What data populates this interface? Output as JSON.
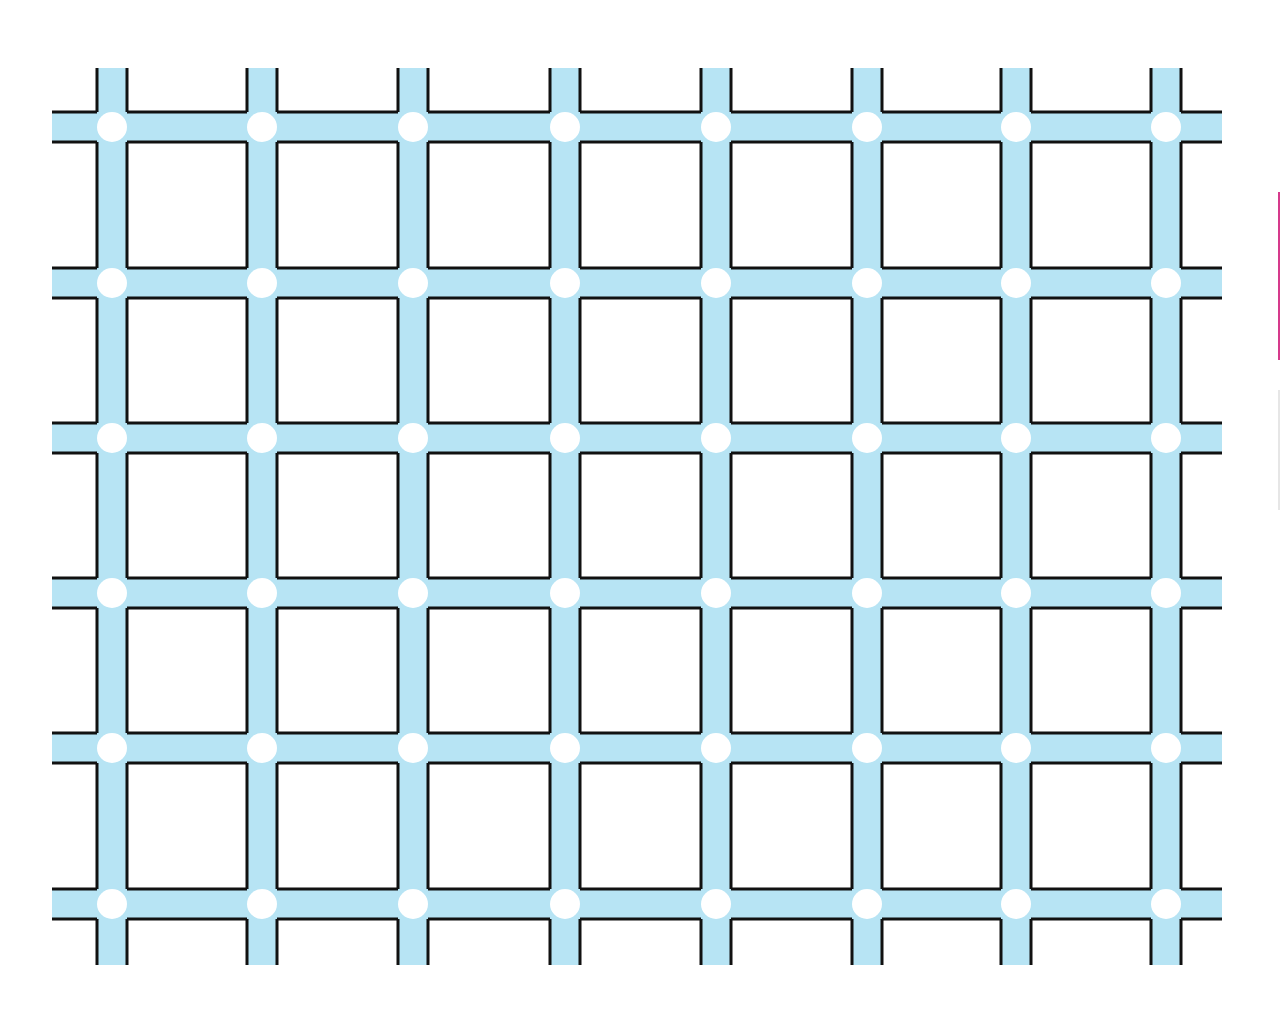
{
  "figure": {
    "rows": 6,
    "cols": 8,
    "band_color": "#b7e4f4",
    "line_color": "#111111",
    "dot_color": "#ffffff",
    "background": "#ffffff",
    "x_centers": [
      112,
      262,
      413,
      565,
      716,
      867,
      1016,
      1166
    ],
    "y_centers": [
      127,
      283,
      438,
      593,
      748,
      904
    ],
    "band_half_width": 15,
    "dot_radius": 15,
    "extent": {
      "left": 52,
      "right": 1222,
      "top": 68,
      "bottom": 965
    }
  },
  "edge_marks": [
    {
      "color": "#d63a8c",
      "top": 192,
      "height": 168
    },
    {
      "color": "#e6e6e6",
      "top": 390,
      "height": 120
    }
  ]
}
